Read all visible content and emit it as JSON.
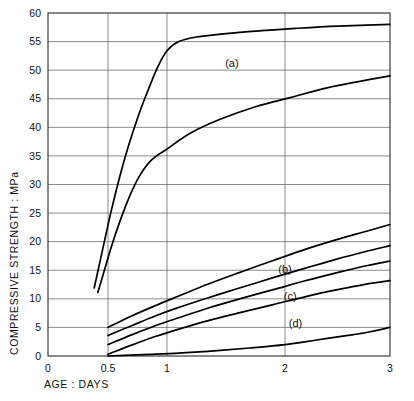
{
  "chart_data": {
    "type": "line",
    "title": "",
    "xlabel": "AGE : DAYS",
    "ylabel": "COMPRESSIVE  STRENGTH  :  MPa",
    "xticklabels": [
      "0",
      "0.5",
      "1",
      "2",
      "3"
    ],
    "xtickvalues": [
      0,
      0.5,
      1,
      2,
      3
    ],
    "yticklabels": [
      "0",
      "5",
      "10",
      "15",
      "20",
      "25",
      "30",
      "35",
      "40",
      "45",
      "50",
      "55",
      "60"
    ],
    "ytickvalues": [
      0,
      5,
      10,
      15,
      20,
      25,
      30,
      35,
      40,
      45,
      50,
      55,
      60
    ],
    "xlim": [
      0,
      3
    ],
    "ylim": [
      0,
      60
    ],
    "grid": true,
    "legend": "inline-annotations",
    "annotations": [
      {
        "text": "(a)",
        "x": 1.55,
        "y": 50.5
      },
      {
        "text": "(b)",
        "x": 2.0,
        "y": 14.6
      },
      {
        "text": "(c)",
        "x": 2.05,
        "y": 9.8
      },
      {
        "text": "(d)",
        "x": 2.1,
        "y": 5.0
      }
    ],
    "series": [
      {
        "name": "a",
        "label": "(a)",
        "points": [
          [
            0.385,
            11.9
          ],
          [
            0.43,
            16.2
          ],
          [
            0.48,
            21.0
          ],
          [
            0.53,
            25.6
          ],
          [
            0.6,
            31.4
          ],
          [
            0.67,
            36.5
          ],
          [
            0.75,
            41.6
          ],
          [
            0.83,
            46.0
          ],
          [
            0.92,
            50.5
          ],
          [
            1.0,
            53.4
          ],
          [
            1.1,
            55.0
          ],
          [
            1.25,
            55.8
          ],
          [
            1.5,
            56.4
          ],
          [
            1.8,
            56.9
          ],
          [
            2.1,
            57.3
          ],
          [
            2.5,
            57.7
          ],
          [
            3.0,
            58.0
          ]
        ]
      },
      {
        "name": "a2",
        "label": "",
        "points": [
          [
            0.415,
            11.1
          ],
          [
            0.47,
            15.0
          ],
          [
            0.53,
            19.2
          ],
          [
            0.6,
            23.5
          ],
          [
            0.68,
            27.8
          ],
          [
            0.77,
            31.6
          ],
          [
            0.87,
            34.3
          ],
          [
            1.0,
            36.2
          ],
          [
            1.2,
            39.0
          ],
          [
            1.45,
            41.4
          ],
          [
            1.75,
            43.6
          ],
          [
            2.05,
            45.2
          ],
          [
            2.4,
            46.9
          ],
          [
            2.7,
            48.0
          ],
          [
            3.0,
            49.0
          ]
        ]
      },
      {
        "name": "b-upper",
        "label": "",
        "points": [
          [
            0.5,
            5.0
          ],
          [
            0.7,
            7.0
          ],
          [
            0.9,
            8.8
          ],
          [
            1.1,
            10.5
          ],
          [
            1.35,
            12.6
          ],
          [
            1.6,
            14.5
          ],
          [
            1.9,
            16.7
          ],
          [
            2.2,
            18.7
          ],
          [
            2.5,
            20.4
          ],
          [
            2.75,
            21.7
          ],
          [
            3.0,
            23.0
          ]
        ]
      },
      {
        "name": "b-lower",
        "label": "(b)",
        "points": [
          [
            0.5,
            3.6
          ],
          [
            0.7,
            5.3
          ],
          [
            0.9,
            7.0
          ],
          [
            1.1,
            8.5
          ],
          [
            1.35,
            10.2
          ],
          [
            1.6,
            11.8
          ],
          [
            1.9,
            13.7
          ],
          [
            2.2,
            15.4
          ],
          [
            2.5,
            17.0
          ],
          [
            2.75,
            18.2
          ],
          [
            3.0,
            19.3
          ]
        ]
      },
      {
        "name": "c",
        "label": "(c)",
        "points": [
          [
            0.5,
            2.0
          ],
          [
            0.7,
            3.7
          ],
          [
            0.9,
            5.3
          ],
          [
            1.1,
            6.7
          ],
          [
            1.35,
            8.4
          ],
          [
            1.6,
            9.9
          ],
          [
            1.9,
            11.6
          ],
          [
            2.2,
            13.2
          ],
          [
            2.5,
            14.6
          ],
          [
            2.75,
            15.7
          ],
          [
            3.0,
            16.6
          ]
        ]
      },
      {
        "name": "c-lower",
        "label": "",
        "points": [
          [
            0.5,
            0.3
          ],
          [
            0.7,
            1.9
          ],
          [
            0.9,
            3.4
          ],
          [
            1.1,
            4.7
          ],
          [
            1.35,
            6.2
          ],
          [
            1.6,
            7.5
          ],
          [
            1.9,
            9.0
          ],
          [
            2.2,
            10.4
          ],
          [
            2.5,
            11.6
          ],
          [
            2.75,
            12.5
          ],
          [
            3.0,
            13.2
          ]
        ]
      },
      {
        "name": "d",
        "label": "(d)",
        "points": [
          [
            0.5,
            0.0
          ],
          [
            0.8,
            0.25
          ],
          [
            1.1,
            0.5
          ],
          [
            1.4,
            0.9
          ],
          [
            1.7,
            1.4
          ],
          [
            2.0,
            2.0
          ],
          [
            2.3,
            2.8
          ],
          [
            2.6,
            3.6
          ],
          [
            2.8,
            4.2
          ],
          [
            3.0,
            5.0
          ]
        ]
      }
    ]
  }
}
